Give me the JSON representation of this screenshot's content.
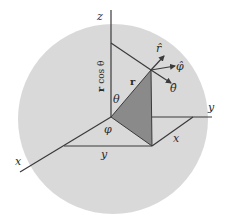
{
  "figure": {
    "colors": {
      "sphere_fill": "#d9d9d9",
      "triangle_fill": "#8a8a8a",
      "line": "#3a3a3a",
      "background": "#ffffff"
    },
    "axes": {
      "z_label": "z",
      "y_label": "y",
      "x_label": "x"
    },
    "vectors": {
      "r_label": "r",
      "r_hat_label": "r̂",
      "phi_hat_label": "φ̂",
      "theta_hat_label": "θ̂"
    },
    "annotations": {
      "r_cos_theta_bold": "r",
      "r_cos_theta_rest": " cos θ",
      "theta_label": "θ",
      "phi_label": "φ",
      "projection_y_label": "y",
      "projection_x_label": "x"
    }
  }
}
